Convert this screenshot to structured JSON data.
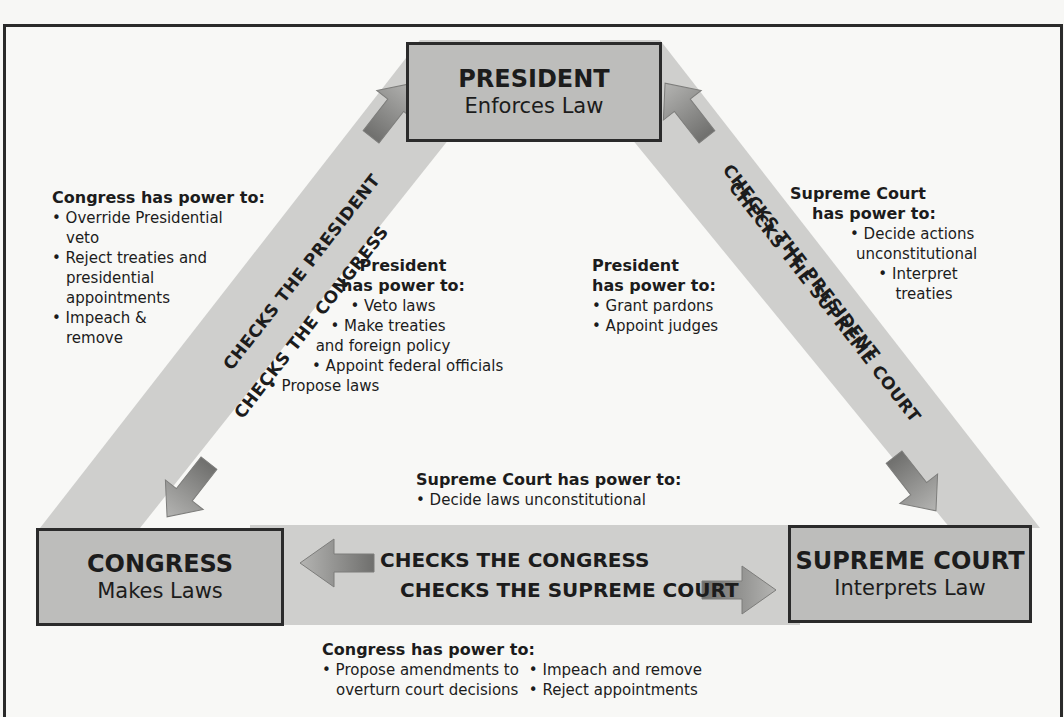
{
  "diagram": {
    "colors": {
      "background": "#f8f8f6",
      "band": "#cfcfcd",
      "box_fill": "#bdbdbb",
      "box_border": "#2b2b2b",
      "arrow": "#8e8e8c",
      "text": "#1c1c1c"
    },
    "branches": {
      "president": {
        "title": "PRESIDENT",
        "role": "Enforces Law"
      },
      "congress": {
        "title": "CONGRESS",
        "role": "Makes Laws"
      },
      "supreme_court": {
        "title": "SUPREME COURT",
        "role": "Interprets Law"
      }
    },
    "bands": {
      "left": {
        "outer": "CHECKS THE PRESIDENT",
        "inner": "CHECKS THE CONGRESS"
      },
      "right": {
        "outer": "CHECKS THE PRESIDENT",
        "inner": "CHECKS THE SUPREME COURT"
      },
      "bottom": {
        "top": "CHECKS THE CONGRESS",
        "bottom": "CHECKS THE SUPREME COURT"
      }
    },
    "notes": {
      "congress_over_president": {
        "heading": "Congress has power to:",
        "items": [
          "• Override Presidential",
          "veto",
          "• Reject treaties and",
          "presidential",
          "appointments",
          "• Impeach &",
          "remove"
        ]
      },
      "president_over_congress": {
        "heading_1": "President",
        "heading_2": "has power to:",
        "items": [
          "• Veto laws",
          "• Make treaties",
          "and foreign policy",
          "• Appoint federal officials",
          "• Propose laws"
        ]
      },
      "president_over_court": {
        "heading_1": "President",
        "heading_2": "has power to:",
        "items": [
          "• Grant pardons",
          "• Appoint judges"
        ]
      },
      "court_over_president": {
        "heading_1": "Supreme Court",
        "heading_2": "has power to:",
        "items": [
          "• Decide actions",
          "unconstitutional",
          "• Interpret",
          "treaties"
        ]
      },
      "court_over_congress": {
        "heading": "Supreme Court has power to:",
        "items": [
          "• Decide laws unconstitutional"
        ]
      },
      "congress_over_court": {
        "heading": "Congress has power to:",
        "col1": [
          "• Propose amendments to",
          "overturn court decisions"
        ],
        "col2": [
          "• Impeach and remove",
          "• Reject appointments"
        ]
      }
    }
  }
}
